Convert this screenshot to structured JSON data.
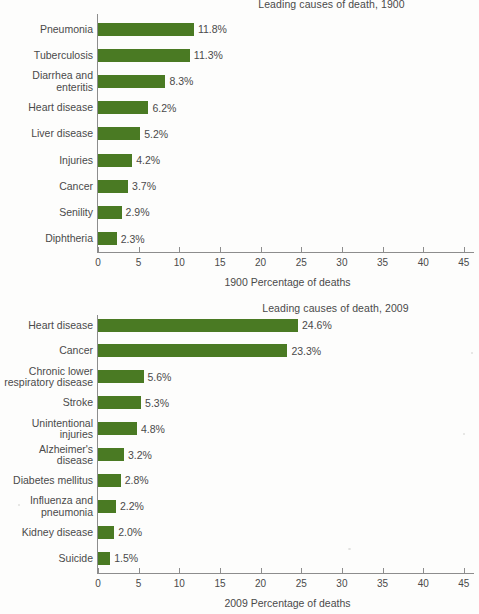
{
  "chart_data": [
    {
      "type": "bar",
      "title": "Leading causes of death, 1900",
      "xlabel": "1900 Percentage of deaths",
      "ylabel": "",
      "orientation": "horizontal",
      "xlim": [
        0,
        45
      ],
      "xticks": [
        "0",
        "5",
        "10",
        "15",
        "20",
        "25",
        "30",
        "35",
        "40",
        "45"
      ],
      "grid": false,
      "legend": "none",
      "series_color": "#4a7a23",
      "categories": [
        "Pneumonia",
        "Tuberculosis",
        "Diarrhea and\nenteritis",
        "Heart disease",
        "Liver disease",
        "Injuries",
        "Cancer",
        "Senility",
        "Diphtheria"
      ],
      "values": [
        11.8,
        11.3,
        8.3,
        6.2,
        5.2,
        4.2,
        3.7,
        2.9,
        2.3
      ],
      "value_labels": [
        "11.8%",
        "11.3%",
        "8.3%",
        "6.2%",
        "5.2%",
        "4.2%",
        "3.7%",
        "2.9%",
        "2.3%"
      ]
    },
    {
      "type": "bar",
      "title": "Leading causes of death, 2009",
      "xlabel": "2009 Percentage of deaths",
      "ylabel": "",
      "orientation": "horizontal",
      "xlim": [
        0,
        45
      ],
      "xticks": [
        "0",
        "5",
        "10",
        "15",
        "20",
        "25",
        "30",
        "35",
        "40",
        "45"
      ],
      "grid": false,
      "legend": "none",
      "series_color": "#4a7a23",
      "categories": [
        "Heart disease",
        "Cancer",
        "Chronic lower\nrespiratory disease",
        "Stroke",
        "Unintentional\ninjuries",
        "Alzheimer's\ndisease",
        "Diabetes mellitus",
        "Influenza and\npneumonia",
        "Kidney disease",
        "Suicide"
      ],
      "values": [
        24.6,
        23.3,
        5.6,
        5.3,
        4.8,
        3.2,
        2.8,
        2.2,
        2.0,
        1.5
      ],
      "value_labels": [
        "24.6%",
        "23.3%",
        "5.6%",
        "5.3%",
        "4.8%",
        "3.2%",
        "2.8%",
        "2.2%",
        "2.0%",
        "1.5%"
      ]
    }
  ]
}
